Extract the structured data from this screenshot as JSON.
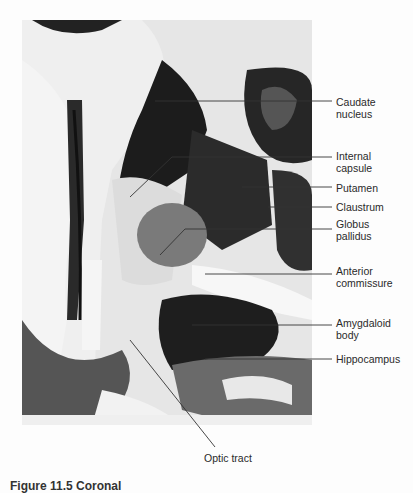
{
  "figure": {
    "type": "labeled brain section photograph",
    "labels": [
      {
        "id": "caudate",
        "text_line1": "Caudate",
        "text_line2": "nucleus",
        "y": 96
      },
      {
        "id": "internal-capsule",
        "text_line1": "Internal",
        "text_line2": "capsule",
        "y": 150
      },
      {
        "id": "putamen",
        "text_line1": "Putamen",
        "text_line2": "",
        "y": 182
      },
      {
        "id": "claustrum",
        "text_line1": "Claustrum",
        "text_line2": "",
        "y": 201
      },
      {
        "id": "globus-pallidus",
        "text_line1": "Globus",
        "text_line2": "pallidus",
        "y": 218
      },
      {
        "id": "anterior-commissure",
        "text_line1": "Anterior",
        "text_line2": "commissure",
        "y": 265
      },
      {
        "id": "amygdaloid",
        "text_line1": "Amygdaloid",
        "text_line2": "body",
        "y": 317
      },
      {
        "id": "hippocampus",
        "text_line1": "Hippocampus",
        "text_line2": "",
        "y": 354
      }
    ],
    "bottom_label": "Optic tract",
    "caption": "Figure 11.5  Coronal"
  }
}
